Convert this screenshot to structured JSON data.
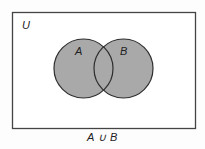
{
  "diagram": {
    "type": "venn",
    "universe_label": "U",
    "sets": [
      {
        "label": "A"
      },
      {
        "label": "B"
      }
    ],
    "shaded_region": "A ∪ B",
    "caption": "A ∪ B",
    "colors": {
      "background": "#fdfdfd",
      "universe_border": "#444444",
      "set_fill": "#a9a9a9",
      "set_stroke": "#2e2e2e",
      "text": "#222222"
    }
  }
}
